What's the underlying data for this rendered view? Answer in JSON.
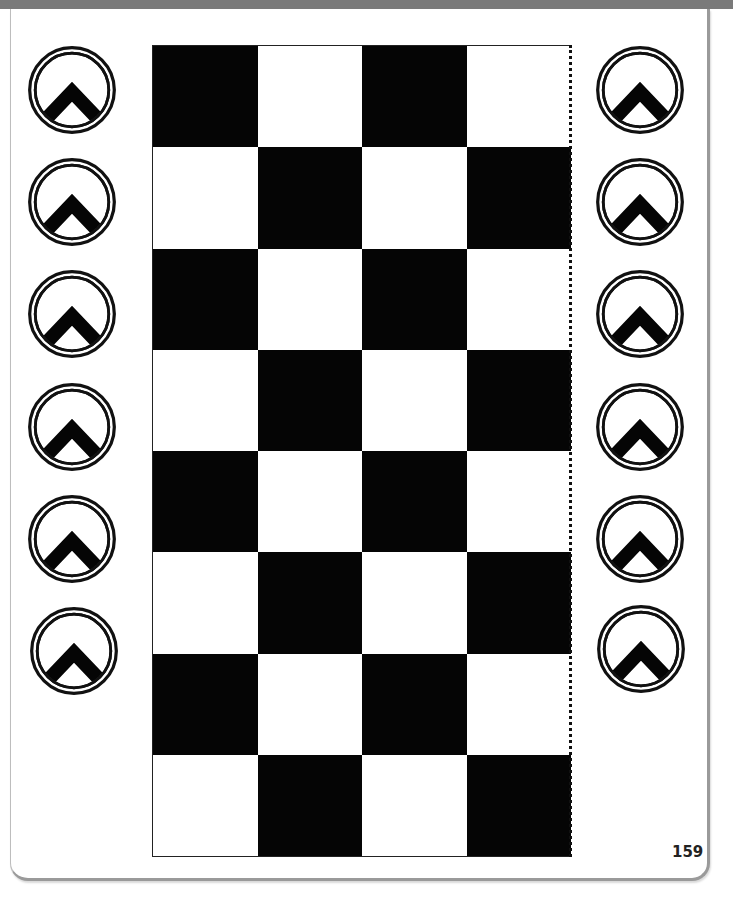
{
  "page": {
    "number": "159",
    "colors": {
      "dark": "#050505",
      "light": "#ffffff",
      "header_bar": "#7a7a7a"
    }
  },
  "board": {
    "columns": 4,
    "rows": 8,
    "pattern": [
      [
        "dark",
        "light",
        "dark",
        "light"
      ],
      [
        "light",
        "dark",
        "light",
        "dark"
      ],
      [
        "dark",
        "light",
        "dark",
        "light"
      ],
      [
        "light",
        "dark",
        "light",
        "dark"
      ],
      [
        "dark",
        "light",
        "dark",
        "light"
      ],
      [
        "light",
        "dark",
        "light",
        "dark"
      ],
      [
        "dark",
        "light",
        "dark",
        "light"
      ],
      [
        "light",
        "dark",
        "light",
        "dark"
      ]
    ]
  },
  "tokens": {
    "icon": "chevron-up-in-double-circle",
    "left": [
      {
        "x": 26,
        "y": 44
      },
      {
        "x": 26,
        "y": 156
      },
      {
        "x": 26,
        "y": 268
      },
      {
        "x": 26,
        "y": 381
      },
      {
        "x": 26,
        "y": 493
      },
      {
        "x": 28,
        "y": 605
      }
    ],
    "right": [
      {
        "x": 594,
        "y": 44
      },
      {
        "x": 594,
        "y": 156
      },
      {
        "x": 594,
        "y": 268
      },
      {
        "x": 594,
        "y": 381
      },
      {
        "x": 594,
        "y": 493
      },
      {
        "x": 595,
        "y": 603
      }
    ]
  }
}
